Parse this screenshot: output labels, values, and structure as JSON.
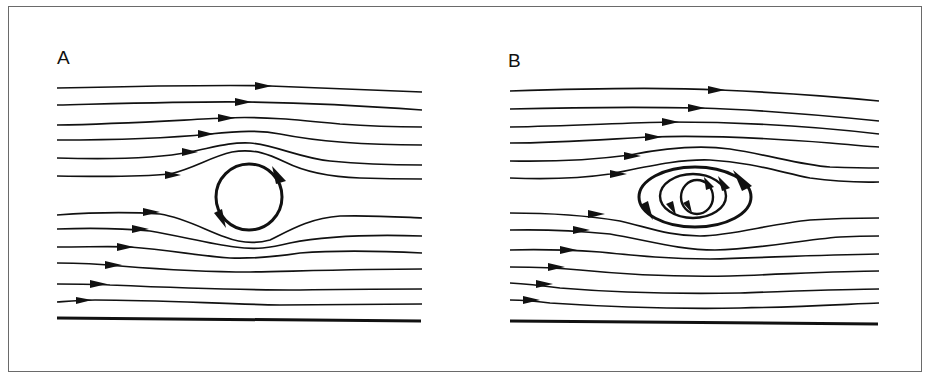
{
  "figure": {
    "type": "streamline-diagram",
    "colors": {
      "line": "#111111",
      "frame": "#6a6a6a",
      "background": "#ffffff"
    }
  },
  "panels": [
    {
      "id": "A",
      "label": "A",
      "vortex": {
        "shape": "circle",
        "cx": 249,
        "cy": 197,
        "r": 33,
        "rotation": "clockwise",
        "arrow_count": 2
      },
      "streamlines_above": 6,
      "streamlines_below": 6,
      "wall": {
        "x1": 57,
        "y1": 318,
        "x2": 421,
        "y2": 321
      }
    },
    {
      "id": "B",
      "label": "B",
      "vortex": {
        "shape": "nested-ellipses",
        "cx": 696,
        "cy": 196,
        "rings": 3,
        "rotation": "clockwise",
        "arrow_count": 5
      },
      "streamlines_above": 6,
      "streamlines_below": 6,
      "wall": {
        "x1": 510,
        "y1": 321,
        "x2": 878,
        "y2": 324
      }
    }
  ]
}
